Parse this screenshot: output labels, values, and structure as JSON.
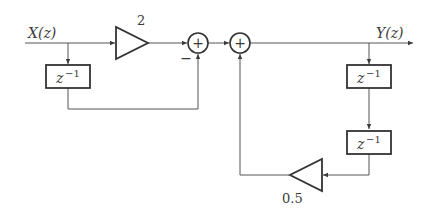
{
  "diagram": {
    "type": "signal-flow block diagram",
    "input": {
      "label": "X(z)"
    },
    "output": {
      "label": "Y(z)"
    },
    "gains": [
      {
        "id": "gain-forward",
        "value": "2"
      },
      {
        "id": "gain-feedback",
        "value": "0.5"
      }
    ],
    "delays": [
      {
        "id": "delay-input",
        "base": "z",
        "exponent": "−1"
      },
      {
        "id": "delay-output-1",
        "base": "z",
        "exponent": "−1"
      },
      {
        "id": "delay-output-2",
        "base": "z",
        "exponent": "−1"
      }
    ],
    "summers": [
      {
        "id": "summer-1",
        "symbol": "+",
        "minus_label": "−"
      },
      {
        "id": "summer-2",
        "symbol": "+"
      }
    ],
    "colors": {
      "stroke": "#3a3a3a",
      "background": "#ffffff"
    }
  }
}
